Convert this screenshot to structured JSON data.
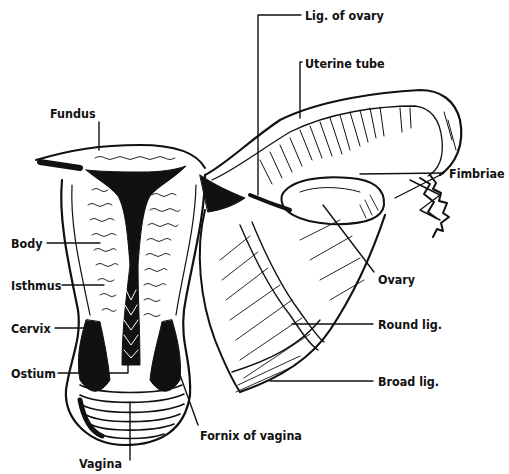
{
  "diagram": {
    "colors": {
      "ink": "#111111",
      "paper": "#ffffff"
    },
    "labels": [
      {
        "id": "lig-of-ovary",
        "text": "Lig. of ovary",
        "x": 305,
        "y": 8
      },
      {
        "id": "uterine-tube",
        "text": "Uterine tube",
        "x": 305,
        "y": 56
      },
      {
        "id": "fundus",
        "text": "Fundus",
        "x": 50,
        "y": 106
      },
      {
        "id": "fimbriae",
        "text": "Fimbriae",
        "x": 449,
        "y": 166
      },
      {
        "id": "body",
        "text": "Body",
        "x": 11,
        "y": 236
      },
      {
        "id": "ovary",
        "text": "Ovary",
        "x": 378,
        "y": 272
      },
      {
        "id": "isthmus",
        "text": "Isthmus",
        "x": 11,
        "y": 278
      },
      {
        "id": "cervix",
        "text": "Cervix",
        "x": 11,
        "y": 321
      },
      {
        "id": "round-lig",
        "text": "Round lig.",
        "x": 378,
        "y": 317
      },
      {
        "id": "ostium",
        "text": "Ostium",
        "x": 11,
        "y": 366
      },
      {
        "id": "broad-lig",
        "text": "Broad lig.",
        "x": 378,
        "y": 374
      },
      {
        "id": "fornix-of-vagina",
        "text": "Fornix of vagina",
        "x": 200,
        "y": 428
      },
      {
        "id": "vagina",
        "text": "Vagina",
        "x": 79,
        "y": 456
      }
    ]
  }
}
